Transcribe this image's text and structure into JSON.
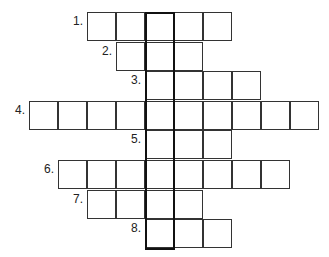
{
  "puzzle": {
    "cell_size": 29,
    "origin": {
      "x": 29,
      "y": 12
    },
    "highlight_column": 4,
    "colors": {
      "line": "#333333",
      "highlight": "#111111",
      "background": "#ffffff"
    },
    "rows": [
      {
        "label": "1.",
        "start_col": 2,
        "end_col": 6
      },
      {
        "label": "2.",
        "start_col": 3,
        "end_col": 5
      },
      {
        "label": "3.",
        "start_col": 4,
        "end_col": 7
      },
      {
        "label": "4.",
        "start_col": 0,
        "end_col": 9
      },
      {
        "label": "5.",
        "start_col": 4,
        "end_col": 6
      },
      {
        "label": "6.",
        "start_col": 1,
        "end_col": 8
      },
      {
        "label": "7.",
        "start_col": 2,
        "end_col": 5
      },
      {
        "label": "8.",
        "start_col": 4,
        "end_col": 6
      }
    ]
  }
}
